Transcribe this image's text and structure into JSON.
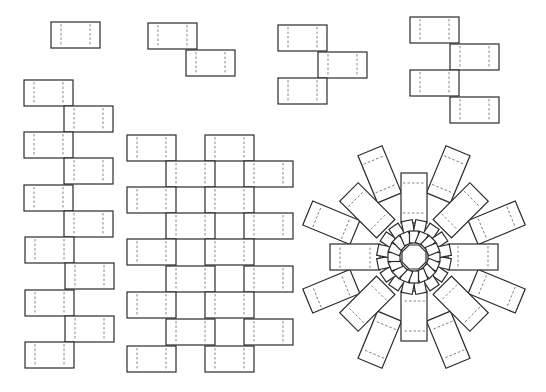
{
  "figure": {
    "colors": {
      "stroke": "#2a2a2a",
      "fold": "#6a6a6a",
      "background": "#ffffff"
    },
    "unit_rect": {
      "width": 49,
      "height": 26,
      "fold_inset": 10
    },
    "chains": [
      {
        "id": "chain-1",
        "rects": [
          [
            51,
            22
          ]
        ]
      },
      {
        "id": "chain-2",
        "rects": [
          [
            148,
            23
          ],
          [
            186,
            50
          ]
        ]
      },
      {
        "id": "chain-3",
        "rects": [
          [
            278,
            25
          ],
          [
            318,
            52
          ],
          [
            278,
            78
          ]
        ]
      },
      {
        "id": "chain-4",
        "rects": [
          [
            410,
            17
          ],
          [
            450,
            44
          ],
          [
            410,
            70
          ],
          [
            450,
            97
          ]
        ]
      },
      {
        "id": "left-column",
        "rects": [
          [
            24,
            80
          ],
          [
            64,
            106
          ],
          [
            24,
            132
          ],
          [
            64,
            158
          ],
          [
            24,
            185
          ],
          [
            64,
            211
          ],
          [
            25,
            237
          ],
          [
            65,
            263
          ],
          [
            25,
            290
          ],
          [
            65,
            316
          ],
          [
            25,
            342
          ]
        ]
      },
      {
        "id": "middle-grid",
        "rects": [
          [
            127,
            135
          ],
          [
            205,
            135
          ],
          [
            166,
            161
          ],
          [
            244,
            161
          ],
          [
            127,
            187
          ],
          [
            205,
            187
          ],
          [
            166,
            213
          ],
          [
            244,
            213
          ],
          [
            127,
            239
          ],
          [
            205,
            239
          ],
          [
            166,
            266
          ],
          [
            244,
            266
          ],
          [
            127,
            292
          ],
          [
            205,
            292
          ],
          [
            166,
            319
          ],
          [
            244,
            319
          ],
          [
            127,
            346
          ],
          [
            205,
            346
          ]
        ]
      }
    ],
    "radial": {
      "center": [
        414,
        257
      ],
      "octagon_radius": 13,
      "inner_ring": {
        "count": 16,
        "r_in": 14,
        "r_out": 26,
        "width": 9
      },
      "middle_ring": {
        "count": 16,
        "r_in": 24,
        "r_out": 37,
        "width": 11
      },
      "arms": [
        {
          "angle": 0,
          "r_in": 34,
          "r_out": 84
        },
        {
          "angle": 90,
          "r_in": 34,
          "r_out": 84
        },
        {
          "angle": 180,
          "r_in": 34,
          "r_out": 84
        },
        {
          "angle": 270,
          "r_in": 34,
          "r_out": 84
        },
        {
          "angle": 45,
          "r_in": 40,
          "r_out": 92
        },
        {
          "angle": 135,
          "r_in": 40,
          "r_out": 92
        },
        {
          "angle": 225,
          "r_in": 40,
          "r_out": 92
        },
        {
          "angle": 315,
          "r_in": 40,
          "r_out": 92
        },
        {
          "angle": 22.5,
          "r_in": 64,
          "r_out": 115
        },
        {
          "angle": 67.5,
          "r_in": 64,
          "r_out": 115
        },
        {
          "angle": 112.5,
          "r_in": 64,
          "r_out": 115
        },
        {
          "angle": 157.5,
          "r_in": 64,
          "r_out": 115
        },
        {
          "angle": 202.5,
          "r_in": 64,
          "r_out": 115
        },
        {
          "angle": 247.5,
          "r_in": 64,
          "r_out": 115
        },
        {
          "angle": 292.5,
          "r_in": 64,
          "r_out": 115
        },
        {
          "angle": 337.5,
          "r_in": 64,
          "r_out": 115
        }
      ],
      "arm_width": 26
    }
  }
}
